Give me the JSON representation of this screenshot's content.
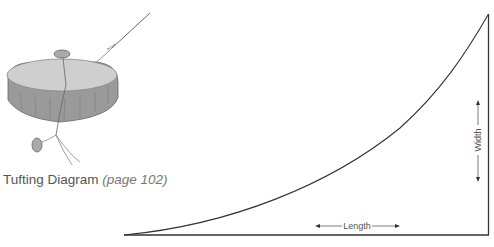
{
  "caption": {
    "title": "Tufting Diagram",
    "page_ref": "(page 102)"
  },
  "pattern": {
    "length_label": "Length",
    "width_label": "Width"
  },
  "colors": {
    "line": "#333333",
    "text": "#555555",
    "cushion_top": "#cfcfcf",
    "cushion_side": "#9a9a9a"
  }
}
